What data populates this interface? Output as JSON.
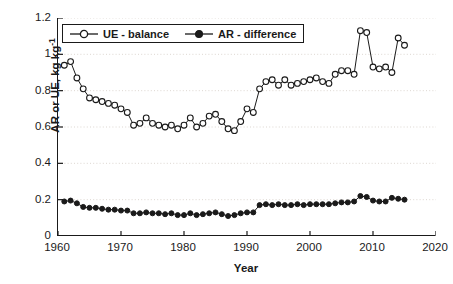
{
  "chart_data": {
    "type": "line",
    "title": "",
    "xlabel": "Year",
    "ylabel": "AR or UE, kg kg",
    "ylabel_sup": "-1",
    "ylabel_full": "AR or UE, kg kg-1",
    "xlim": [
      1960,
      2020
    ],
    "ylim": [
      0,
      1.2
    ],
    "xticks": [
      1960,
      1970,
      1980,
      1990,
      2000,
      2010,
      2020
    ],
    "xticklabels": [
      "1960",
      "1970",
      "1980",
      "1990",
      "2000",
      "2010",
      "2020"
    ],
    "yticks": [
      0,
      0.2,
      0.4,
      0.6,
      0.8,
      1,
      1.2
    ],
    "yticklabels": [
      "0",
      "0.2",
      "0.4",
      "0.6",
      "0.8",
      "1",
      "1.2"
    ],
    "grid": "horizontal-dotted",
    "legend_position": "top-left-inside",
    "x": [
      1961,
      1962,
      1963,
      1964,
      1965,
      1966,
      1967,
      1968,
      1969,
      1970,
      1971,
      1972,
      1973,
      1974,
      1975,
      1976,
      1977,
      1978,
      1979,
      1980,
      1981,
      1982,
      1983,
      1984,
      1985,
      1986,
      1987,
      1988,
      1989,
      1990,
      1991,
      1992,
      1993,
      1994,
      1995,
      1996,
      1997,
      1998,
      1999,
      2000,
      2001,
      2002,
      2003,
      2004,
      2005,
      2006,
      2007,
      2008,
      2009,
      2010,
      2011,
      2012,
      2013,
      2014,
      2015
    ],
    "series": [
      {
        "name": "UE - balance",
        "marker": "open-circle",
        "color": "#1a1a1a",
        "values": [
          0.94,
          0.96,
          0.87,
          0.81,
          0.76,
          0.75,
          0.74,
          0.73,
          0.72,
          0.7,
          0.68,
          0.61,
          0.62,
          0.65,
          0.62,
          0.61,
          0.6,
          0.61,
          0.59,
          0.61,
          0.65,
          0.6,
          0.62,
          0.66,
          0.67,
          0.63,
          0.59,
          0.58,
          0.63,
          0.7,
          0.68,
          0.81,
          0.85,
          0.86,
          0.83,
          0.86,
          0.83,
          0.84,
          0.85,
          0.86,
          0.87,
          0.85,
          0.84,
          0.89,
          0.91,
          0.91,
          0.89,
          1.13,
          1.12,
          0.93,
          0.92,
          0.93,
          0.9,
          1.09,
          1.05
        ]
      },
      {
        "name": "AR - difference",
        "marker": "filled-circle",
        "color": "#1a1a1a",
        "values": [
          0.19,
          0.195,
          0.18,
          0.16,
          0.155,
          0.155,
          0.15,
          0.145,
          0.145,
          0.14,
          0.14,
          0.125,
          0.125,
          0.13,
          0.125,
          0.125,
          0.12,
          0.125,
          0.115,
          0.115,
          0.125,
          0.115,
          0.12,
          0.125,
          0.13,
          0.12,
          0.11,
          0.115,
          0.125,
          0.13,
          0.13,
          0.17,
          0.175,
          0.17,
          0.175,
          0.17,
          0.17,
          0.175,
          0.17,
          0.175,
          0.175,
          0.175,
          0.175,
          0.18,
          0.185,
          0.185,
          0.19,
          0.22,
          0.215,
          0.195,
          0.19,
          0.19,
          0.21,
          0.205,
          0.2
        ]
      }
    ]
  },
  "legend": {
    "items": [
      {
        "label": "UE - balance",
        "marker": "open-circle"
      },
      {
        "label": "AR - difference",
        "marker": "filled-circle"
      }
    ]
  },
  "axes": {
    "x_title": "Year",
    "y_title_main": "AR or UE, kg kg",
    "y_title_exp": "-1"
  }
}
